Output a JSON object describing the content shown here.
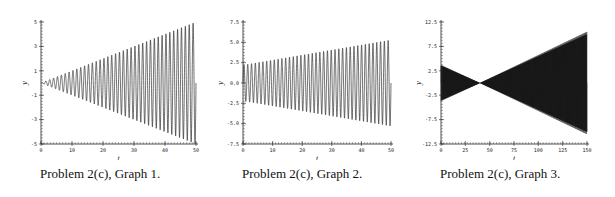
{
  "chart_data": [
    {
      "type": "line",
      "title": "",
      "caption": "Problem 2(c), Graph 1.",
      "xlabel": "t",
      "ylabel": "y",
      "xlim": [
        0,
        50
      ],
      "ylim": [
        -5,
        5
      ],
      "xticks": [
        "0",
        "10",
        "20",
        "30",
        "40",
        "50"
      ],
      "xtick_values": [
        0,
        10,
        20,
        30,
        40,
        50
      ],
      "yticks": [
        "5",
        "3",
        "1",
        "-1",
        "-3",
        "-5"
      ],
      "ytick_values": [
        5,
        3,
        1,
        -1,
        -3,
        -5
      ],
      "grid": false,
      "series": [
        {
          "name": "y(t)",
          "description": "oscillation with linearly growing envelope",
          "amplitude_at_start": 0.0,
          "amplitude_at_end": 5.0,
          "cycles": 40
        }
      ]
    },
    {
      "type": "line",
      "title": "",
      "caption": "Problem 2(c), Graph 2.",
      "xlabel": "t",
      "ylabel": "y",
      "xlim": [
        0,
        50
      ],
      "ylim": [
        -7.5,
        7.5
      ],
      "xticks": [
        "0",
        "10",
        "20",
        "30",
        "40",
        "50"
      ],
      "xtick_values": [
        0,
        10,
        20,
        30,
        40,
        50
      ],
      "yticks": [
        "7.5",
        "5.0",
        "2.5",
        "0.0",
        "-2.5",
        "-5.0",
        "-7.5"
      ],
      "ytick_values": [
        7.5,
        5.0,
        2.5,
        0.0,
        -2.5,
        -5.0,
        -7.5
      ],
      "grid": false,
      "series": [
        {
          "name": "y(t)",
          "description": "oscillation with slowly growing envelope",
          "amplitude_at_start": 2.2,
          "amplitude_at_end": 5.3,
          "cycles": 39
        }
      ]
    },
    {
      "type": "line",
      "title": "",
      "caption": "Problem 2(c), Graph 3.",
      "xlabel": "t",
      "ylabel": "y",
      "xlim": [
        0,
        150
      ],
      "ylim": [
        -12.5,
        12.5
      ],
      "xticks": [
        "0",
        "25",
        "50",
        "75",
        "100",
        "125",
        "150"
      ],
      "xtick_values": [
        0,
        25,
        50,
        75,
        100,
        125,
        150
      ],
      "yticks": [
        "12.5",
        "7.5",
        "2.5",
        "-2.5",
        "-7.5",
        "-12.5"
      ],
      "ytick_values": [
        12.5,
        7.5,
        2.5,
        -2.5,
        -7.5,
        -12.5
      ],
      "grid": false,
      "series": [
        {
          "name": "y(t)",
          "description": "dense oscillation; envelope shrinks to zero near t=40 then grows",
          "amplitude_at_start": 3.7,
          "node_t": 40,
          "amplitude_at_end": 10.5,
          "cycles": 600
        }
      ]
    }
  ]
}
